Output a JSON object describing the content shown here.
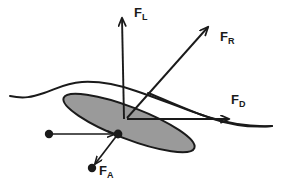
{
  "figure": {
    "background_color": "#ffffff",
    "stroke_color": "#1a1a1a",
    "disc": {
      "name": "inclined-disc",
      "fill_color": "#9a9a9a",
      "outline_color": "#1a1a1a",
      "center_x": 129,
      "center_y": 123,
      "radius_x": 70,
      "radius_y": 16,
      "rotation_deg": 21
    },
    "flow_curve": {
      "name": "flow-streamline",
      "description": "wavy streamline passing over the disc"
    },
    "origin": {
      "x": 127,
      "y": 118
    },
    "vectors": [
      {
        "id": "FL",
        "symbol": "F",
        "subscript": "L",
        "name": "lift-force-vector",
        "description": "Lift force, vertical upward",
        "x1": 124,
        "y1": 118,
        "x2": 122,
        "y2": 14
      },
      {
        "id": "FR",
        "symbol": "F",
        "subscript": "R",
        "name": "resultant-force-vector",
        "description": "Resultant force, up and to the right",
        "x1": 127,
        "y1": 118,
        "x2": 211,
        "y2": 24
      },
      {
        "id": "FD",
        "symbol": "F",
        "subscript": "D",
        "name": "drag-force-vector",
        "description": "Drag force, horizontal to the right",
        "x1": 127,
        "y1": 119,
        "x2": 233,
        "y2": 119
      },
      {
        "id": "FA",
        "symbol": "F",
        "subscript": "A",
        "name": "applied-force-vector",
        "description": "Applied force, down and to the left",
        "x1": 118,
        "y1": 134,
        "x2": 93,
        "y2": 167
      },
      {
        "id": "FIN",
        "symbol": "",
        "subscript": "",
        "name": "incoming-flow-vector",
        "description": "Incoming horizontal flow arrow ending at disc node",
        "x1": 50,
        "y1": 134,
        "x2": 118,
        "y2": 134
      }
    ],
    "nodes": [
      {
        "name": "flow-origin-dot",
        "x": 49,
        "y": 134,
        "r": 4.2
      },
      {
        "name": "disc-contact-node",
        "x": 118,
        "y": 134,
        "r": 4.2
      },
      {
        "name": "applied-force-endpoint-dot",
        "x": 92,
        "y": 168,
        "r": 4.2
      }
    ],
    "labels": {
      "FL": {
        "symbol": "F",
        "subscript": "L"
      },
      "FR": {
        "symbol": "F",
        "subscript": "R"
      },
      "FD": {
        "symbol": "F",
        "subscript": "D"
      },
      "FA": {
        "symbol": "F",
        "subscript": "A"
      }
    }
  }
}
